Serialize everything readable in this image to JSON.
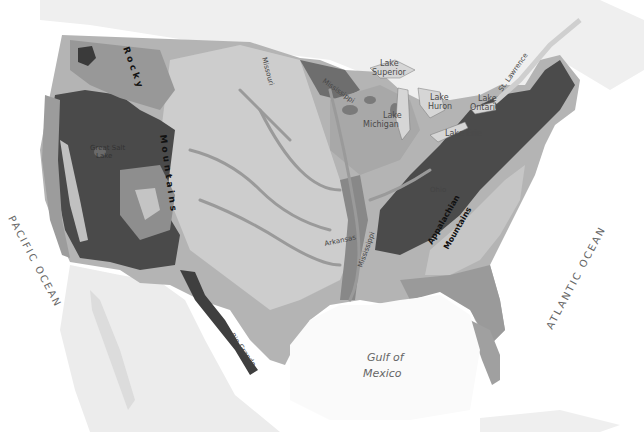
{
  "map": {
    "title": "Physiographic map of the contiguous United States",
    "style": "grayscale",
    "colors": {
      "background": "#ffffff",
      "neighbor_land": "#ebebeb",
      "water": "#f7f7f7",
      "lake": "#d9d9d9",
      "plains_light": "#c8c8c8",
      "plains_mid": "#a8a8a8",
      "uplands_mid": "#8c8c8c",
      "mountains_dark": "#4d4d4d",
      "mountains_darker": "#3a3a3a",
      "river": "#9a9a9a"
    },
    "labels": {
      "oceans": {
        "pacific": "PACIFIC OCEAN",
        "atlantic": "ATLANTIC OCEAN",
        "gulf_line1": "Gulf of",
        "gulf_line2": "Mexico"
      },
      "lakes": {
        "superior_line1": "Lake",
        "superior_line2": "Superior",
        "michigan_line1": "Lake",
        "michigan_line2": "Michigan",
        "huron_line1": "Lake",
        "huron_line2": "Huron",
        "ontario_line1": "Lake",
        "ontario_line2": "Ontario",
        "erie": "Lake Erie",
        "great_salt_line1": "Great Salt",
        "great_salt_line2": "Lake"
      },
      "rivers": {
        "missouri": "Missouri",
        "mississippi_north": "Mississippi",
        "mississippi_south": "Mississippi",
        "arkansas": "Arkansas",
        "ohio": "Ohio",
        "st_lawrence": "St. Lawrence",
        "rio_grande": "Rio Grande"
      },
      "mountains": {
        "rocky_word1": "Rocky",
        "rocky_word2": "Mountains",
        "appalachian_line1": "Appalachian",
        "appalachian_line2": "Mountains"
      }
    }
  }
}
